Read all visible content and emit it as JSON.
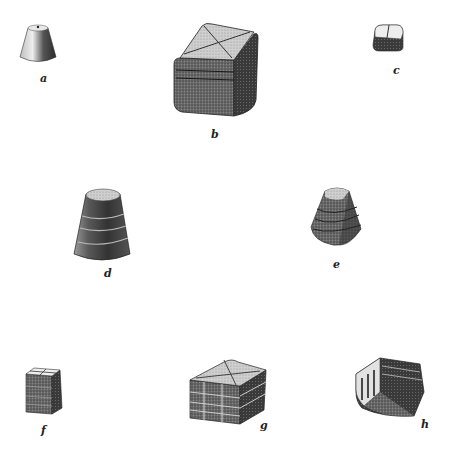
{
  "plate": {
    "description": "Illustration of eight carved stone weights",
    "items": [
      {
        "id": "a",
        "label": "a",
        "shape": "truncated cone with small top hole"
      },
      {
        "id": "b",
        "label": "b",
        "shape": "cube with X-incised top and horizontal grooves"
      },
      {
        "id": "c",
        "label": "c",
        "shape": "small rounded cube with single top groove"
      },
      {
        "id": "d",
        "label": "d",
        "shape": "truncated cone with horizontal grooves"
      },
      {
        "id": "e",
        "label": "e",
        "shape": "rounded pyramid with horizontal grooves"
      },
      {
        "id": "f",
        "label": "f",
        "shape": "small block with cross-incised top and grooves"
      },
      {
        "id": "g",
        "label": "g",
        "shape": "square block with X-incised top, horizontal and vertical grooves"
      },
      {
        "id": "h",
        "label": "h",
        "shape": "block with vertical fluting and horizontal grooves"
      }
    ]
  },
  "colors": {
    "ink": "#222222",
    "shade": "#444444",
    "mid": "#888888",
    "light": "#d8d8d8"
  }
}
